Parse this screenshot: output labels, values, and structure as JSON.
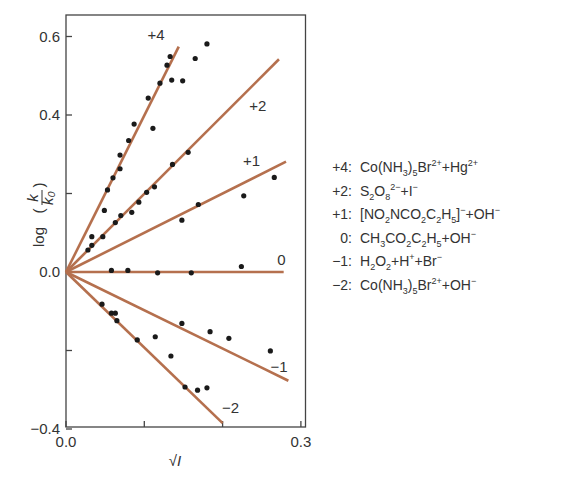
{
  "chart_data": {
    "type": "scatter",
    "title": "",
    "xlabel": "√I",
    "ylabel": "log (k/k₀)",
    "xlim": [
      0.0,
      0.3
    ],
    "ylim": [
      -0.4,
      0.65
    ],
    "x_ticks": [
      0.0,
      0.1,
      0.2,
      0.3
    ],
    "x_tick_labels": [
      "0.0",
      "",
      "",
      "0.3"
    ],
    "y_ticks": [
      -0.4,
      -0.2,
      0.0,
      0.2,
      0.4,
      0.6
    ],
    "y_tick_labels": [
      "−0.4",
      "",
      "0.0",
      "",
      "0.4",
      "0.6"
    ],
    "grid": false,
    "legend_position": "right, outside plot",
    "line_color": "#b5704e",
    "point_color": "#1a1a1a",
    "series": [
      {
        "name": "+4",
        "label": "+4",
        "reaction": "Co(NH3)5Br2+ + Hg2+",
        "fit_line": [
          [
            0.0,
            0.0
          ],
          [
            0.144,
            0.574
          ]
        ],
        "label_pos": [
          0.115,
          0.59
        ],
        "points": [
          [
            0.028,
            0.056
          ],
          [
            0.033,
            0.068
          ],
          [
            0.033,
            0.09
          ],
          [
            0.049,
            0.157
          ],
          [
            0.053,
            0.209
          ],
          [
            0.06,
            0.24
          ],
          [
            0.069,
            0.263
          ],
          [
            0.069,
            0.298
          ],
          [
            0.08,
            0.335
          ],
          [
            0.087,
            0.377
          ],
          [
            0.111,
            0.366
          ],
          [
            0.105,
            0.443
          ],
          [
            0.12,
            0.481
          ],
          [
            0.129,
            0.527
          ],
          [
            0.133,
            0.549
          ],
          [
            0.135,
            0.489
          ],
          [
            0.149,
            0.487
          ],
          [
            0.165,
            0.544
          ],
          [
            0.18,
            0.581
          ]
        ]
      },
      {
        "name": "+2",
        "label": "+2",
        "reaction": "S2O8 2- + I-",
        "fit_line": [
          [
            0.0,
            0.0
          ],
          [
            0.272,
            0.542
          ]
        ],
        "label_pos": [
          0.245,
          0.41
        ],
        "points": [
          [
            0.047,
            0.09
          ],
          [
            0.063,
            0.126
          ],
          [
            0.07,
            0.144
          ],
          [
            0.084,
            0.152
          ],
          [
            0.093,
            0.178
          ],
          [
            0.103,
            0.203
          ],
          [
            0.113,
            0.217
          ],
          [
            0.136,
            0.274
          ],
          [
            0.156,
            0.305
          ]
        ]
      },
      {
        "name": "+1",
        "label": "+1",
        "reaction": "[NO2NCO2C2H5]- + OH-",
        "fit_line": [
          [
            0.0,
            0.0
          ],
          [
            0.281,
            0.281
          ]
        ],
        "label_pos": [
          0.237,
          0.27
        ],
        "points": [
          [
            0.148,
            0.132
          ],
          [
            0.169,
            0.172
          ],
          [
            0.227,
            0.194
          ],
          [
            0.266,
            0.241
          ]
        ]
      },
      {
        "name": "0",
        "label": "0",
        "reaction": "CH3CO2C2H5 + OH-",
        "fit_line": [
          [
            0.0,
            0.0
          ],
          [
            0.278,
            0.0
          ]
        ],
        "label_pos": [
          0.275,
          0.018
        ],
        "points": [
          [
            0.058,
            0.004
          ],
          [
            0.079,
            0.004
          ],
          [
            0.117,
            -0.002
          ],
          [
            0.16,
            -0.002
          ],
          [
            0.224,
            0.014
          ]
        ]
      },
      {
        "name": "-1",
        "label": "−1",
        "reaction": "H2O2 + H+ + Br-",
        "fit_line": [
          [
            0.0,
            0.0
          ],
          [
            0.284,
            -0.277
          ]
        ],
        "label_pos": [
          0.272,
          -0.255
        ],
        "points": [
          [
            0.114,
            -0.165
          ],
          [
            0.148,
            -0.131
          ],
          [
            0.184,
            -0.152
          ],
          [
            0.208,
            -0.169
          ],
          [
            0.261,
            -0.201
          ]
        ]
      },
      {
        "name": "-2",
        "label": "−2",
        "reaction": "Co(NH3)5Br2+ + OH-",
        "fit_line": [
          [
            0.0,
            0.0
          ],
          [
            0.2,
            -0.385
          ]
        ],
        "label_pos": [
          0.21,
          -0.36
        ],
        "points": [
          [
            0.046,
            -0.082
          ],
          [
            0.058,
            -0.105
          ],
          [
            0.063,
            -0.105
          ],
          [
            0.065,
            -0.124
          ],
          [
            0.091,
            -0.173
          ],
          [
            0.134,
            -0.214
          ],
          [
            0.152,
            -0.293
          ],
          [
            0.168,
            -0.301
          ],
          [
            0.18,
            -0.295
          ]
        ]
      }
    ]
  },
  "legend": {
    "rows": [
      {
        "key": "+4:",
        "html": "Co(NH<sub>3</sub>)<sub>5</sub>Br<sup>2+</sup>+Hg<sup>2+</sup>"
      },
      {
        "key": "+2:",
        "html": "S<sub>2</sub>O<sub>8</sub><sup>2−</sup>+I<sup>−</sup>"
      },
      {
        "key": "+1:",
        "html": "[NO<sub>2</sub>NCO<sub>2</sub>C<sub>2</sub>H<sub>5</sub>]<sup>−</sup>+OH<sup>−</sup>"
      },
      {
        "key": "0:",
        "html": "CH<sub>3</sub>CO<sub>2</sub>C<sub>2</sub>H<sub>5</sub>+OH<sup>−</sup>"
      },
      {
        "key": "−1:",
        "html": "H<sub>2</sub>O<sub>2</sub>+H<sup>+</sup>+Br<sup>−</sup>"
      },
      {
        "key": "−2:",
        "html": "Co(NH<sub>3</sub>)<sub>5</sub>Br<sup>2+</sup>+OH<sup>−</sup>"
      }
    ]
  }
}
